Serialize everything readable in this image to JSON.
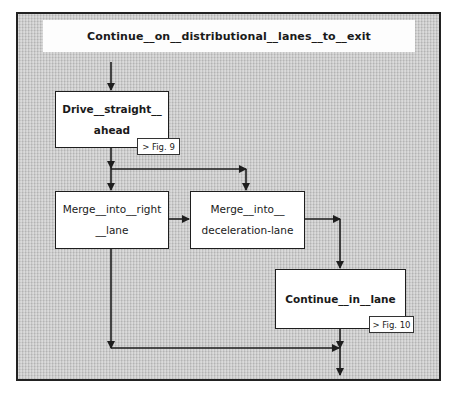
{
  "diagram": {
    "title": "Continue__on__distributional__lanes__to__exit",
    "nodes": {
      "drive": {
        "line1": "Drive__straight__",
        "line2": "ahead",
        "ref": "> Fig. 9"
      },
      "merge_right": {
        "line1": "Merge__into__right",
        "line2": "__lane"
      },
      "merge_decel": {
        "line1": "Merge__into__",
        "line2": "deceleration-lane"
      },
      "continue_lane": {
        "line1": "Continue__in__lane",
        "ref": "> Fig. 10"
      }
    },
    "edges": [
      {
        "from": "title",
        "to": "drive"
      },
      {
        "from": "drive",
        "to": "merge_right"
      },
      {
        "from": "drive",
        "to": "merge_decel"
      },
      {
        "from": "merge_right",
        "to": "merge_decel"
      },
      {
        "from": "merge_decel",
        "to": "continue_lane"
      },
      {
        "from": "merge_right",
        "to": "exit"
      },
      {
        "from": "continue_lane",
        "to": "exit"
      }
    ],
    "colors": {
      "background": "#c9c9c9",
      "box": "#ffffff",
      "line": "#1e1e1e"
    }
  }
}
